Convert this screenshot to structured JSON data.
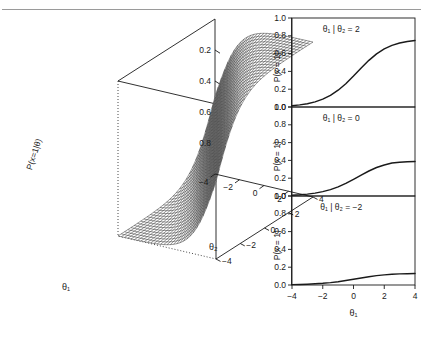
{
  "figure": {
    "rule_top": true,
    "background": "#ffffff",
    "ink": "#1a1a1a"
  },
  "chart_data": [
    {
      "type": "surface",
      "title": "",
      "xlabel": "θ₁",
      "ylabel": "θ₂",
      "zlabel": "P(x=1|θ)",
      "xlim": [
        -4,
        4
      ],
      "ylim": [
        -4,
        4
      ],
      "zlim": [
        0,
        1
      ],
      "xticks": [
        -4,
        -2,
        0,
        2
      ],
      "yticks": [
        -4,
        -2,
        0,
        2,
        4
      ],
      "zticks": [
        0.2,
        0.4,
        0.6,
        0.8
      ],
      "grid": false,
      "legend": "none",
      "surface_model": "logistic",
      "formula": "P(x=1|θ₁,θ₂) = 1/(1+exp(-(θ₁+θ₂)))",
      "mesh_nx": 30,
      "mesh_ny": 30,
      "wireframe": true
    },
    {
      "type": "line",
      "title": "θ₁ | θ₂ = 2",
      "xlabel": "",
      "ylabel": "P(x = 1)",
      "xlim": [
        -4,
        4
      ],
      "ylim": [
        0,
        1
      ],
      "xticks": [
        -4,
        -2,
        0,
        2,
        4
      ],
      "yticks": [
        0.0,
        0.2,
        0.4,
        0.6,
        0.8,
        1.0
      ],
      "ytick_labels": [
        "0.0",
        "0.2",
        "0.4",
        "0.6",
        "0.8",
        "1.0"
      ],
      "grid": false,
      "legend": "none",
      "asymptote": 0.75,
      "x": [
        -4,
        -3.5,
        -3,
        -2.5,
        -2,
        -1.5,
        -1,
        -0.5,
        0,
        0.5,
        1,
        1.5,
        2,
        2.5,
        3,
        3.5,
        4
      ],
      "values": [
        0.015,
        0.024,
        0.037,
        0.058,
        0.088,
        0.131,
        0.189,
        0.262,
        0.348,
        0.438,
        0.524,
        0.597,
        0.653,
        0.693,
        0.719,
        0.736,
        0.748
      ]
    },
    {
      "type": "line",
      "title": "θ₁ | θ₂ = 0",
      "xlabel": "",
      "ylabel": "P(x = 1)",
      "xlim": [
        -4,
        4
      ],
      "ylim": [
        0,
        1
      ],
      "xticks": [
        -4,
        -2,
        0,
        2,
        4
      ],
      "yticks": [
        0.0,
        0.2,
        0.4,
        0.6,
        0.8,
        1.0
      ],
      "ytick_labels": [
        "0.0",
        "0.2",
        "0.4",
        "0.6",
        "0.8",
        "1.0"
      ],
      "grid": false,
      "legend": "none",
      "asymptote": 0.39,
      "x": [
        -4,
        -3.5,
        -3,
        -2.5,
        -2,
        -1.5,
        -1,
        -0.5,
        0,
        0.5,
        1,
        1.5,
        2,
        2.5,
        3,
        3.5,
        4
      ],
      "values": [
        0.008,
        0.013,
        0.021,
        0.032,
        0.049,
        0.072,
        0.103,
        0.142,
        0.188,
        0.235,
        0.281,
        0.32,
        0.349,
        0.37,
        0.38,
        0.385,
        0.388
      ]
    },
    {
      "type": "line",
      "title": "θ₁ | θ₂ = −2",
      "xlabel": "θ₁",
      "ylabel": "P(x = 1)",
      "xlim": [
        -4,
        4
      ],
      "ylim": [
        0,
        1
      ],
      "xticks": [
        -4,
        -2,
        0,
        2,
        4
      ],
      "xtick_labels": [
        "−4",
        "−2",
        "0",
        "2",
        "4"
      ],
      "yticks": [
        0.0,
        0.2,
        0.4,
        0.6,
        0.8,
        1.0
      ],
      "ytick_labels": [
        "0.0",
        "0.2",
        "0.4",
        "0.6",
        "0.8",
        "1.0"
      ],
      "grid": false,
      "legend": "none",
      "asymptote": 0.13,
      "x": [
        -4,
        -3.5,
        -3,
        -2.5,
        -2,
        -1.5,
        -1,
        -0.5,
        0,
        0.5,
        1,
        1.5,
        2,
        2.5,
        3,
        3.5,
        4
      ],
      "values": [
        0.004,
        0.006,
        0.009,
        0.013,
        0.019,
        0.027,
        0.037,
        0.05,
        0.064,
        0.079,
        0.093,
        0.105,
        0.114,
        0.121,
        0.125,
        0.127,
        0.129
      ]
    }
  ],
  "panel3d": {
    "zlabel": "P(x=1|θ)",
    "xlabel": "θ₁",
    "ylabel": "θ₂",
    "ztick_labels": [
      "0.8",
      "0.6",
      "0.4",
      "0.2"
    ],
    "xtick_labels": [
      "−4",
      "−2",
      "0",
      "2"
    ],
    "ytick_labels": [
      "−4",
      "−2",
      "0",
      "2",
      "4"
    ]
  },
  "panels_right": [
    {
      "annotation": "θ₁ | θ₂ = 2",
      "ytick_labels": [
        "1.0",
        "0.8",
        "0.6",
        "0.4",
        "0.2",
        "0.0"
      ],
      "ylabel": "P(x = 1)"
    },
    {
      "annotation": "θ₁ | θ₂ = 0",
      "ytick_labels": [
        "1.0",
        "0.8",
        "0.6",
        "0.4",
        "0.2",
        "0.0"
      ],
      "ylabel": "P(x = 1)"
    },
    {
      "annotation": "θ₁ | θ₂ = −2",
      "ytick_labels": [
        "1.0",
        "0.8",
        "0.6",
        "0.4",
        "0.2",
        "0.0"
      ],
      "ylabel": "P(x = 1)"
    }
  ],
  "axis_bottom": {
    "tick_labels": [
      "−4",
      "−2",
      "0",
      "2",
      "4"
    ],
    "label": "θ₁"
  }
}
